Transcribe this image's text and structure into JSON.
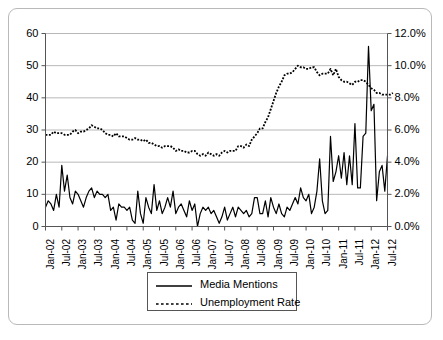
{
  "chart_data": {
    "type": "line",
    "title": "",
    "subtitle": "",
    "xlabel": "",
    "ylabel": "",
    "y2label": "",
    "grid": true,
    "legend_position": "bottom-center",
    "ylim": [
      0,
      60
    ],
    "y2lim": [
      0,
      0.12
    ],
    "yticks": [
      "0",
      "10",
      "20",
      "30",
      "40",
      "50",
      "60"
    ],
    "ytick_values": [
      0,
      10,
      20,
      30,
      40,
      50,
      60
    ],
    "y2ticks": [
      "0.0%",
      "2.0%",
      "4.0%",
      "6.0%",
      "8.0%",
      "10.0%",
      "12.0%"
    ],
    "y2tick_values": [
      0,
      2,
      4,
      6,
      8,
      10,
      12
    ],
    "xticks": [
      "Jan-02",
      "Jul-02",
      "Jan-03",
      "Jul-03",
      "Jan-04",
      "Jul-04",
      "Jan-05",
      "Jul-05",
      "Jan-06",
      "Jul-06",
      "Jan-07",
      "Jul-07",
      "Jan-08",
      "Jul-08",
      "Jan-09",
      "Jul-09",
      "Jan-10",
      "Jul-10",
      "Jan-11",
      "Jul-11",
      "Jan-12",
      "Jul-12"
    ],
    "x_start": "Jan-02",
    "x_end": "Jul-12",
    "x_interval": "monthly",
    "x_tick_interval_months": 6,
    "n_points": 127,
    "series": [
      {
        "name": "Media Mentions",
        "axis": "left",
        "style": "solid",
        "color": "#000000",
        "values": [
          6,
          8,
          7,
          5,
          10,
          6,
          19,
          11,
          16,
          9,
          7,
          11,
          10,
          8,
          6,
          9,
          11,
          12,
          9,
          11,
          10,
          10,
          9,
          10,
          5,
          6,
          2,
          7,
          6,
          6,
          5,
          6,
          2,
          1,
          11,
          4,
          1,
          9,
          6,
          4,
          13,
          5,
          8,
          4,
          6,
          9,
          6,
          11,
          4,
          6,
          7,
          5,
          3,
          8,
          5,
          7,
          0,
          4,
          6,
          5,
          6,
          4,
          5,
          3,
          1,
          3,
          6,
          2,
          4,
          6,
          3,
          6,
          5,
          4,
          5,
          3,
          4,
          9,
          9,
          4,
          4,
          8,
          3,
          9,
          6,
          4,
          7,
          4,
          3,
          6,
          5,
          7,
          9,
          7,
          12,
          9,
          8,
          10,
          4,
          6,
          11,
          21,
          8,
          4,
          5,
          28,
          14,
          17,
          22,
          15,
          23,
          13,
          22,
          13,
          32,
          12,
          12,
          28,
          29,
          56,
          36,
          38,
          8,
          17,
          19,
          11,
          22
        ]
      },
      {
        "name": "Unemployment Rate",
        "axis": "right",
        "style": "dotted",
        "color": "#000000",
        "values": [
          5.7,
          5.7,
          5.7,
          5.9,
          5.8,
          5.8,
          5.8,
          5.7,
          5.7,
          5.7,
          5.9,
          6.0,
          5.8,
          5.9,
          5.9,
          6.0,
          6.1,
          6.3,
          6.2,
          6.1,
          6.1,
          6.0,
          5.8,
          5.7,
          5.7,
          5.6,
          5.8,
          5.6,
          5.6,
          5.6,
          5.5,
          5.4,
          5.4,
          5.5,
          5.4,
          5.4,
          5.3,
          5.4,
          5.2,
          5.2,
          5.1,
          5.0,
          5.0,
          4.9,
          5.0,
          5.0,
          5.0,
          4.9,
          4.7,
          4.8,
          4.7,
          4.7,
          4.6,
          4.6,
          4.7,
          4.7,
          4.5,
          4.4,
          4.5,
          4.4,
          4.6,
          4.5,
          4.4,
          4.5,
          4.4,
          4.6,
          4.7,
          4.6,
          4.7,
          4.7,
          4.7,
          5.0,
          5.0,
          4.9,
          5.1,
          5.0,
          5.4,
          5.6,
          5.8,
          6.1,
          6.1,
          6.5,
          6.8,
          7.3,
          7.8,
          8.3,
          8.7,
          9.0,
          9.4,
          9.5,
          9.5,
          9.6,
          9.8,
          10.0,
          9.9,
          9.9,
          9.8,
          9.8,
          9.9,
          9.9,
          9.6,
          9.4,
          9.5,
          9.5,
          9.5,
          9.8,
          9.4,
          9.8,
          9.3,
          9.1,
          9.0,
          9.0,
          8.9,
          8.8,
          9.0,
          9.0,
          9.1,
          9.1,
          9.0,
          8.8,
          8.6,
          8.5,
          8.3,
          8.3,
          8.2,
          8.2,
          8.2,
          8.2,
          8.3
        ]
      }
    ]
  },
  "legend": {
    "items": [
      {
        "label": "Media Mentions",
        "style": "solid"
      },
      {
        "label": "Unemployment Rate",
        "style": "dotted"
      }
    ]
  }
}
